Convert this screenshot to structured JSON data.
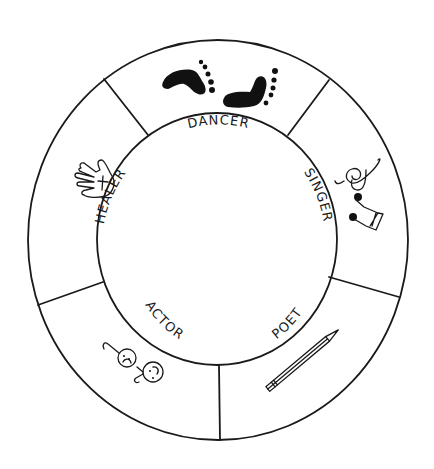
{
  "diagram": {
    "type": "ring-wheel",
    "style": "hand-drawn black ink on white",
    "center_label": "",
    "segments": [
      {
        "label": "DANCER",
        "icon": "footprints-icon",
        "position": "top"
      },
      {
        "label": "SINGER",
        "icon": "music-notes-icon",
        "position": "right"
      },
      {
        "label": "POET",
        "icon": "pencil-icon",
        "position": "bottom-right"
      },
      {
        "label": "ACTOR",
        "icon": "theater-masks-icon",
        "position": "bottom-left"
      },
      {
        "label": "HEALER",
        "icon": "hand-with-cross-icon",
        "position": "left"
      }
    ]
  },
  "colors": {
    "ink": "#1a1a1a",
    "background": "#ffffff"
  }
}
